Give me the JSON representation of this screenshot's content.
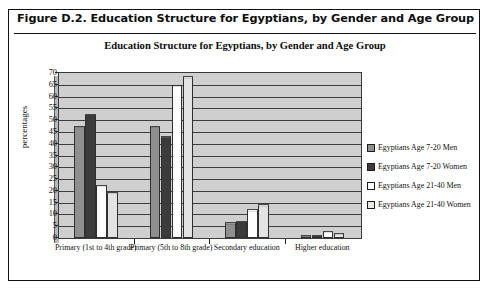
{
  "figure": {
    "caption": "Figure D.2.  Education Structure for Egyptians, by Gender and Age Group"
  },
  "chart_data": {
    "type": "bar",
    "title": "Education Structure for Egyptians, by Gender and Age Group",
    "xlabel": "",
    "ylabel": "percentages",
    "ylim": [
      0,
      70
    ],
    "ytick_step": 5,
    "yticks": [
      "70",
      "65",
      "60",
      "55",
      "50",
      "45",
      "40",
      "35",
      "30",
      "25",
      "20",
      "15",
      "10",
      "5",
      "0"
    ],
    "grid": true,
    "legend_position": "right",
    "categories": [
      "Primary (1st to 4th grade)",
      "Primary (5th to 8th grade)",
      "Secondary education",
      "Higher education"
    ],
    "series": [
      {
        "name": "Egyptians Age 7-20 Men",
        "color": "#8f8f8f",
        "values": [
          47,
          47,
          6.0,
          0.4
        ]
      },
      {
        "name": "Egyptians Age 7-20 Women",
        "color": "#3b3b3b",
        "values": [
          52,
          42.5,
          6.6,
          0.3
        ]
      },
      {
        "name": "Egyptians Age 21-40 Men",
        "color": "#ffffff",
        "values": [
          22,
          64.5,
          11.5,
          2.5
        ]
      },
      {
        "name": "Egyptians Age 21-40 Women",
        "color": "#e3e3e3",
        "values": [
          19,
          68,
          13.7,
          1.6
        ]
      }
    ]
  }
}
